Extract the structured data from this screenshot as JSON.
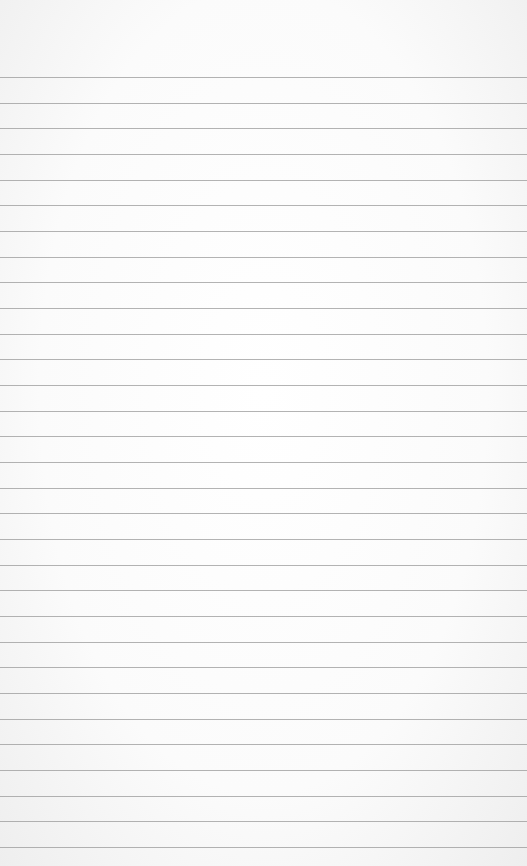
{
  "paper": {
    "type": "lined-notebook-page",
    "line_color": "#9a9a9a",
    "background_color": "#fbfbfb",
    "first_line_y": 77,
    "line_spacing": 25.67,
    "line_count": 31
  }
}
